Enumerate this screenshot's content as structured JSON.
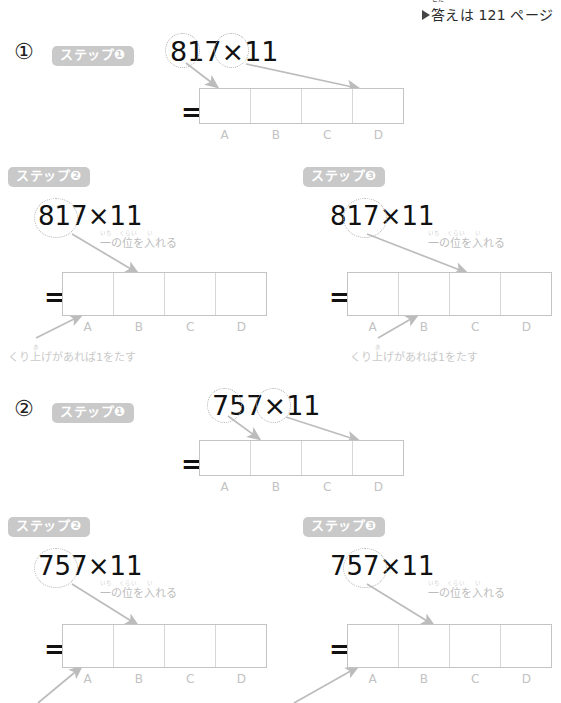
{
  "header": {
    "marker": "triangle-right",
    "text_before": "",
    "kanji": "答",
    "ruby": "こた",
    "text_after": "えは 121 ページ",
    "full_text": "答えは 121 ページ"
  },
  "labels": {
    "cells": [
      "A",
      "B",
      "C",
      "D"
    ],
    "equals": "=",
    "note_ones": "一の位を入れる",
    "note_ones_ruby": [
      "いち",
      "くらい",
      "い"
    ],
    "note_carry": "くり上げがあれば1をたす",
    "note_carry_ruby": "あ"
  },
  "problems": [
    {
      "number": "①",
      "expression": "817×11",
      "steps": [
        {
          "badge": "ステップ❶",
          "expression": "817×11",
          "circled": [
            "8",
            "7"
          ],
          "note": "",
          "carry_note": ""
        },
        {
          "badge": "ステップ❷",
          "expression": "817×11",
          "circled": [
            "81"
          ],
          "note": "一の位を入れる",
          "carry_note": "くり上げがあれば1をたす",
          "carry_target": "A"
        },
        {
          "badge": "ステップ❸",
          "expression": "817×11",
          "circled": [
            "17"
          ],
          "note": "一の位を入れる",
          "carry_note": "くり上げがあれば1をたす",
          "carry_target": "B"
        }
      ]
    },
    {
      "number": "②",
      "expression": "757×11",
      "steps": [
        {
          "badge": "ステップ❶",
          "expression": "757×11",
          "circled": [
            "7",
            "7"
          ],
          "note": "",
          "carry_note": ""
        },
        {
          "badge": "ステップ❷",
          "expression": "757×11",
          "circled": [
            "75"
          ],
          "note": "一の位を入れる",
          "carry_note": "",
          "carry_target": "A"
        },
        {
          "badge": "ステップ❸",
          "expression": "757×11",
          "circled": [
            "57"
          ],
          "note": "一の位を入れる",
          "carry_note": "",
          "carry_target": "B"
        }
      ]
    }
  ],
  "colors": {
    "badge_bg": "#c9c9c9",
    "badge_text": "#ffffff",
    "grid_border": "#c4c4c4",
    "arrow": "#bcbcbc",
    "label_text": "#c2c2c2",
    "digit_text": "#111111"
  }
}
